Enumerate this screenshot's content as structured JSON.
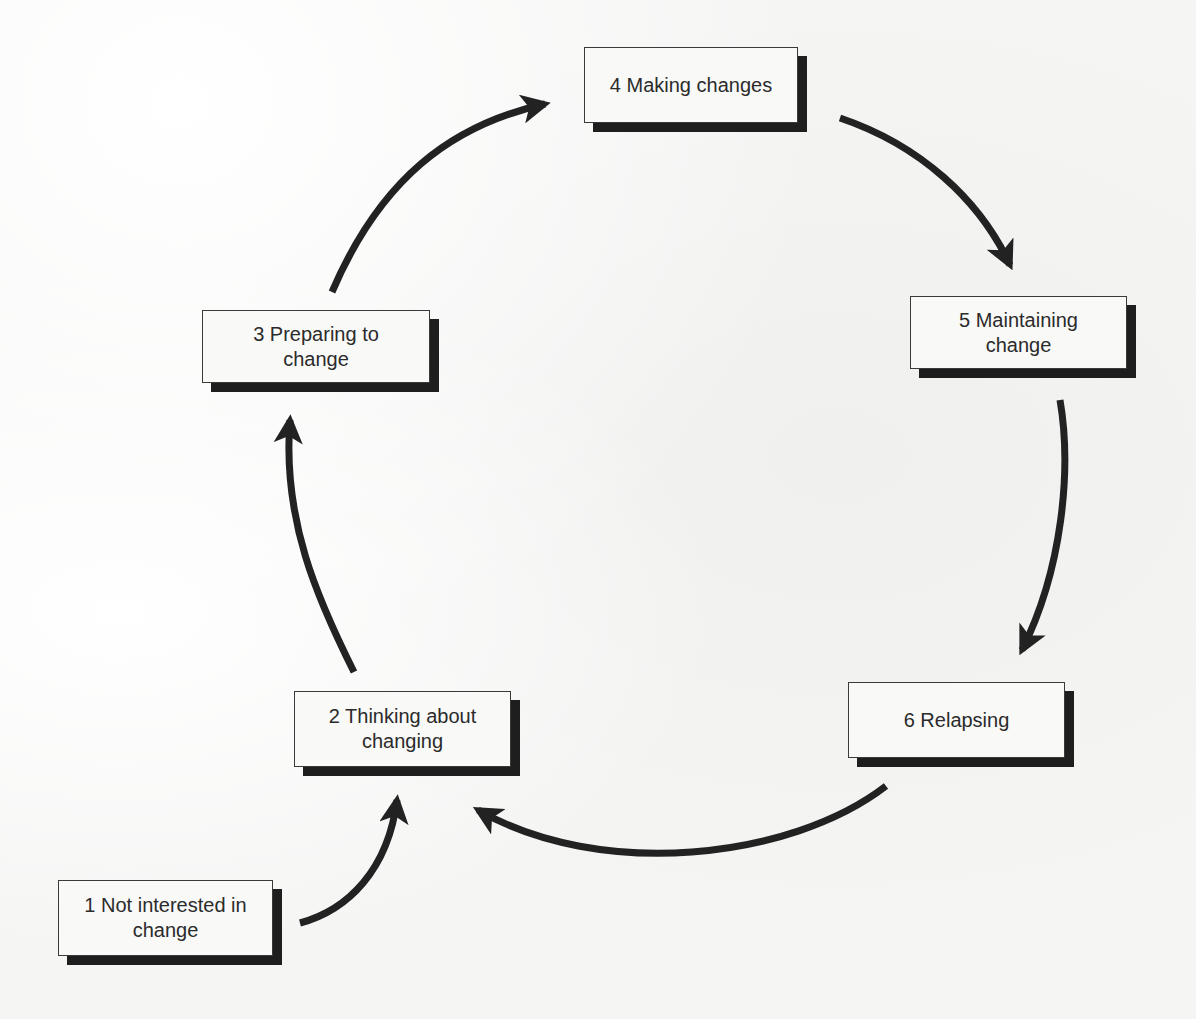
{
  "diagram": {
    "type": "cycle",
    "colors": {
      "box_fill": "#f9f9f8",
      "box_border": "#3a3a3a",
      "shadow": "#1e1e1e",
      "arrow": "#222222",
      "text": "#2b2b2b"
    },
    "stages": [
      {
        "id": 1,
        "label": "1 Not interested in\nchange"
      },
      {
        "id": 2,
        "label": "2 Thinking about\nchanging"
      },
      {
        "id": 3,
        "label": "3 Preparing to\nchange"
      },
      {
        "id": 4,
        "label": "4 Making changes"
      },
      {
        "id": 5,
        "label": "5 Maintaining\nchange"
      },
      {
        "id": 6,
        "label": "6 Relapsing"
      }
    ],
    "arrows": [
      {
        "from": 1,
        "to": 2
      },
      {
        "from": 2,
        "to": 3
      },
      {
        "from": 3,
        "to": 4
      },
      {
        "from": 4,
        "to": 5
      },
      {
        "from": 5,
        "to": 6
      },
      {
        "from": 6,
        "to": 2
      }
    ]
  }
}
